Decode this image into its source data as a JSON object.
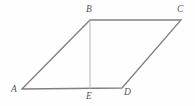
{
  "figure": {
    "type": "geometry-diagram",
    "canvas": {
      "width": 195,
      "height": 106,
      "background": "#fefefe"
    },
    "style": {
      "outline_color": "#808080",
      "outline_width": 1.3,
      "altitude_color": "#b5b5b5",
      "altitude_width": 1.0,
      "label_color": "#55545a",
      "label_font_size": 9.5,
      "label_style": "italic-serif"
    },
    "points": [
      {
        "id": "A",
        "label": "A",
        "x": 22,
        "y": 89,
        "label_x": 11,
        "label_y": 84
      },
      {
        "id": "B",
        "label": "B",
        "x": 90,
        "y": 20,
        "label_x": 86,
        "label_y": 4
      },
      {
        "id": "C",
        "label": "C",
        "x": 181,
        "y": 20,
        "label_x": 177,
        "label_y": 4
      },
      {
        "id": "D",
        "label": "D",
        "x": 122,
        "y": 88,
        "label_x": 124,
        "label_y": 87
      },
      {
        "id": "E",
        "label": "E",
        "x": 90,
        "y": 89,
        "label_x": 86,
        "label_y": 91
      }
    ],
    "edges": [
      {
        "id": "AB",
        "from": "A",
        "to": "B",
        "kind": "outline"
      },
      {
        "id": "BC",
        "from": "B",
        "to": "C",
        "kind": "outline"
      },
      {
        "id": "CD",
        "from": "C",
        "to": "D",
        "kind": "outline"
      },
      {
        "id": "DA",
        "from": "D",
        "to": "A",
        "kind": "outline"
      }
    ],
    "segments": [
      {
        "id": "BE",
        "from": "B",
        "to": "E",
        "kind": "altitude"
      }
    ],
    "outline_path": "M 22 89 L 90 20 L 181 20 L 122 88 Z",
    "altitude_path": "M 90 20 L 90 89"
  }
}
